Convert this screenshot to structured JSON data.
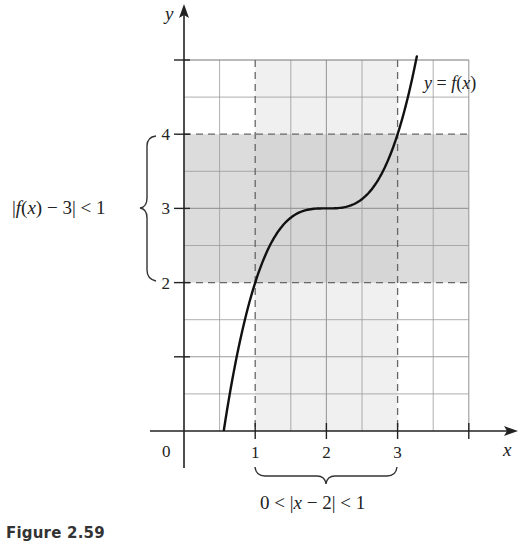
{
  "caption": "Figure 2.59",
  "chart_data": {
    "type": "line",
    "title": "",
    "function_label": "y = f(x)",
    "function": "f(x) = (x - 2)^3 + 3",
    "xlabel": "x",
    "ylabel": "y",
    "xlim": [
      0,
      4.6
    ],
    "ylim": [
      0,
      5.4
    ],
    "grid": true,
    "grid_step": 0.5,
    "x_ticks": [
      {
        "value": 0,
        "label": "0"
      },
      {
        "value": 1,
        "label": "1"
      },
      {
        "value": 2,
        "label": "2"
      },
      {
        "value": 3,
        "label": "3"
      },
      {
        "value": 4,
        "label": ""
      }
    ],
    "y_ticks": [
      {
        "value": 1,
        "label": ""
      },
      {
        "value": 2,
        "label": "2"
      },
      {
        "value": 3,
        "label": "3"
      },
      {
        "value": 4,
        "label": "4"
      },
      {
        "value": 5,
        "label": ""
      }
    ],
    "series": [
      {
        "name": "y = f(x)",
        "x": [
          0.56,
          0.8,
          1.0,
          1.25,
          1.5,
          1.75,
          2.0,
          2.25,
          2.5,
          2.75,
          3.0,
          3.2,
          3.27
        ],
        "y": [
          0.01,
          1.27,
          2.0,
          2.58,
          2.88,
          2.98,
          3.0,
          3.02,
          3.13,
          3.42,
          4.0,
          4.73,
          5.05
        ]
      }
    ],
    "shaded_regions": [
      {
        "axis": "y",
        "from": 2,
        "to": 4,
        "label": "|f(x) − 3| < 1"
      },
      {
        "axis": "x",
        "from": 1,
        "to": 3,
        "label": "0 < |x − 2| < 1"
      }
    ],
    "dashed_lines": [
      {
        "axis": "y",
        "value": 2
      },
      {
        "axis": "y",
        "value": 4
      },
      {
        "axis": "x",
        "value": 1
      },
      {
        "axis": "x",
        "value": 3
      }
    ],
    "annotations": {
      "y_brace_label": "|f(x) − 3| < 1",
      "x_brace_label": "0 < |x − 2| < 1",
      "origin_label": "0"
    }
  },
  "colors": {
    "curve": "#111111",
    "axis": "#222222",
    "grid": "#9a9a9a",
    "band_overlap": "#d6d6d6",
    "band_y": "#dcdcdc",
    "band_x": "#f0f0f0",
    "dashed": "#666666"
  }
}
